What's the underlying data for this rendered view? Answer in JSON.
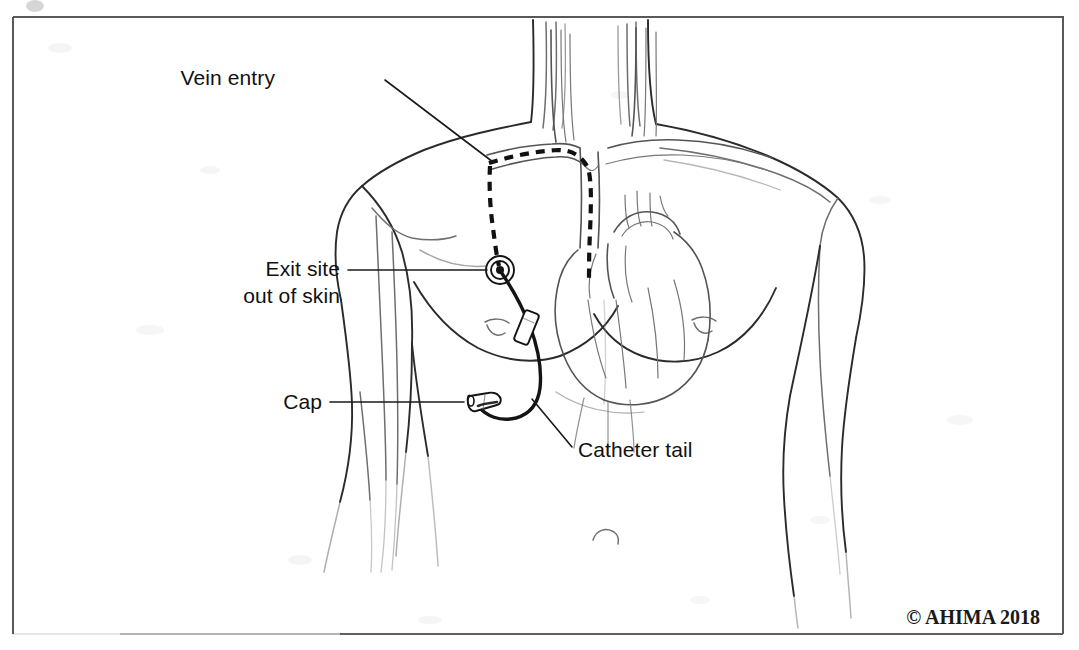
{
  "figure": {
    "kind": "medical-illustration",
    "view": "anterior torso, line drawing",
    "background_color": "#ffffff",
    "line_color": "#2b2b2b",
    "border": {
      "present": true,
      "color": "#595959",
      "note": "thin rectangular rule around illustration, fading at lower-left"
    }
  },
  "labels": [
    {
      "id": "vein-entry",
      "text": "Vein entry",
      "lines": [
        "Vein entry"
      ],
      "anchor": "right",
      "text_x": 275,
      "text_y": 85,
      "leader_from": [
        385,
        80
      ],
      "leader_to": [
        493,
        162
      ],
      "points_at": "subclavian vein puncture site where the catheter enters the vein"
    },
    {
      "id": "exit-site",
      "text": "Exit site out of skin",
      "lines": [
        "Exit site",
        "out of skin"
      ],
      "anchor": "right",
      "text_x": 243,
      "text_y": 276,
      "leader_from": [
        348,
        270
      ],
      "leader_to": [
        487,
        270
      ],
      "points_at": "concentric ring exit wound on the chest wall"
    },
    {
      "id": "cap",
      "text": "Cap",
      "lines": [
        "Cap"
      ],
      "anchor": "right",
      "text_x": 282,
      "text_y": 408,
      "leader_from": [
        330,
        402
      ],
      "leader_to": [
        464,
        402
      ],
      "points_at": "protective cap on the end of the catheter tail"
    },
    {
      "id": "catheter-tail",
      "text": "Catheter tail",
      "lines": [
        "Catheter tail"
      ],
      "anchor": "left",
      "text_x": 578,
      "text_y": 457,
      "leader_from": [
        572,
        447
      ],
      "leader_to": [
        532,
        399
      ],
      "points_at": "external segment of catheter tubing below the exit site"
    }
  ],
  "credit": {
    "text": "© AHIMA 2018",
    "x": 930,
    "y": 624,
    "style": "bold serif"
  },
  "anatomy_parts": [
    "neck",
    "left shoulder",
    "right shoulder",
    "left arm",
    "right arm",
    "chest wall",
    "left breast",
    "right breast",
    "navel",
    "heart",
    "aortic arch",
    "superior vena cava",
    "subclavian vein",
    "jugular vessels",
    "arm veins"
  ],
  "device_parts": [
    {
      "name": "tunneled-catheter-intravenous-segment",
      "rendering": "dashed line",
      "note": "runs from vein entry through subclavian vein and SVC to the heart"
    },
    {
      "name": "catheter-subcutaneous-tunnel",
      "rendering": "dashed line",
      "note": "runs under the skin from vein entry down to the exit site"
    },
    {
      "name": "exit-site-marker",
      "rendering": "concentric circles",
      "center": [
        500,
        270
      ]
    },
    {
      "name": "catheter-external-tubing",
      "rendering": "solid tube"
    },
    {
      "name": "catheter-clamp",
      "rendering": "small rectangle on tubing"
    },
    {
      "name": "catheter-cap",
      "rendering": "tapered cylinder at tubing end"
    }
  ]
}
